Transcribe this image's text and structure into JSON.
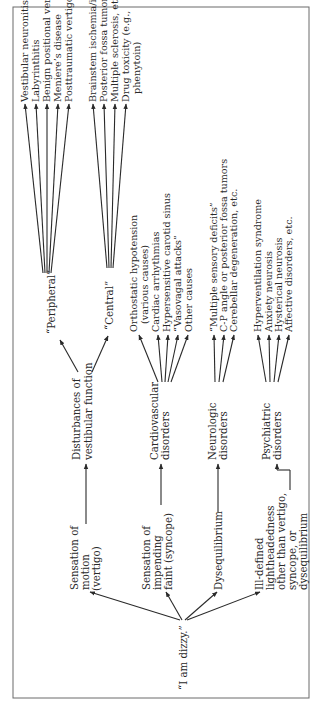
{
  "diagram": {
    "root": {
      "label": "“I am dizzy.”"
    },
    "complaints": [
      {
        "lines": [
          "Sensation of",
          "motion",
          "(vertigo)"
        ]
      },
      {
        "lines": [
          "Sensation of",
          "impending",
          "faint (syncope)"
        ]
      },
      {
        "lines": [
          "Dysequilibrium"
        ]
      },
      {
        "lines": [
          "Ill-defined",
          "lightheadedness",
          "other than vertigo,",
          "syncope, or",
          "dysequilibrium"
        ]
      }
    ],
    "categories": [
      {
        "lines": [
          "Disturbances of",
          "vestibular function"
        ]
      },
      {
        "lines": [
          "Cardiovascular",
          "disorders"
        ]
      },
      {
        "lines": [
          "Neurologic",
          "disorders"
        ]
      },
      {
        "lines": [
          "Psychiatric",
          "disorders"
        ]
      }
    ],
    "vestibular_subtypes": [
      {
        "label": "“Peripheral”"
      },
      {
        "label": "“Central”"
      }
    ],
    "peripheral_causes": [
      "Vestibular neuronitis",
      "Labyrinthitis",
      "Benign positional vertigo",
      "Meniere’s disease",
      "Posttraumatic vertigo, etc."
    ],
    "central_causes": [
      "Brainstem ischemia/infarct",
      "Posterior fossa tumors",
      "Multiple sclerosis, etc.",
      "Drug toxicity (e.g.,",
      "phenytoin)"
    ],
    "cardiovascular_causes": [
      "Orthostatic hypotension",
      "(various causes)",
      "Cardiac arrhythmias",
      "Hypersensitive carotid sinus",
      "“Vasovagal attacks”",
      "Other causes"
    ],
    "neurologic_causes": [
      "“Multiple sensory deficits”",
      "C-P angle or posterior fossa tumors",
      "Cerebellar degeneration, etc."
    ],
    "psychiatric_causes": [
      "Hyperventilation syndrome",
      "Anxiety neurosis",
      "Hysterical neurosis",
      "Affective disorders, etc."
    ]
  },
  "style": {
    "ink": "#2a2a2a",
    "frame": "#6a6a6a",
    "background": "#ffffff"
  }
}
